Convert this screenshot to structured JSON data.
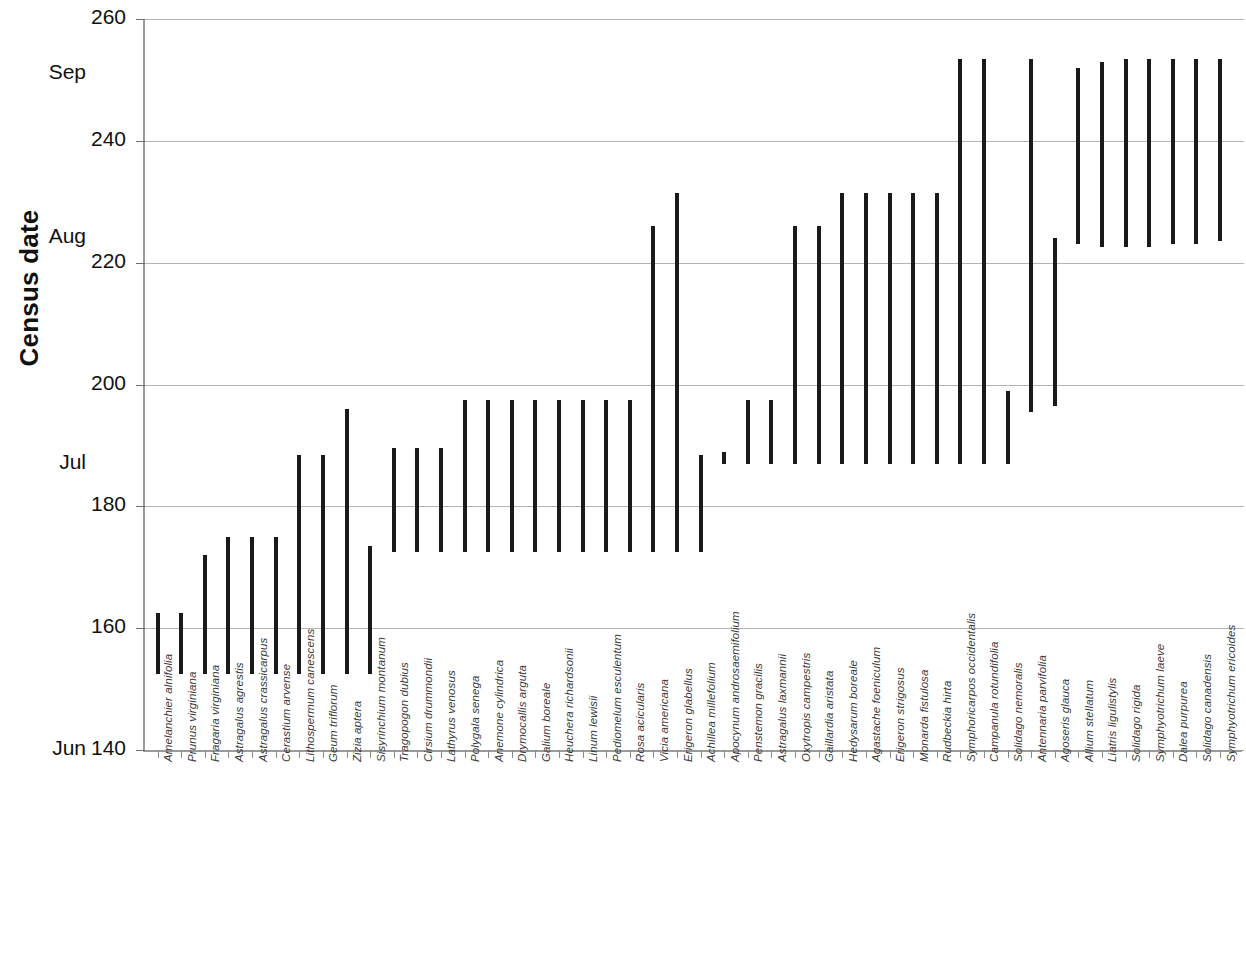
{
  "chart_data": {
    "type": "bar",
    "title": "",
    "subtitle": "",
    "xlabel": "",
    "ylabel": "Census date",
    "ylim": [
      140,
      260
    ],
    "ytick_values": [
      140,
      160,
      180,
      200,
      220,
      240,
      260
    ],
    "ytick_labels": [
      "140",
      "160",
      "180",
      "200",
      "220",
      "240",
      "260"
    ],
    "month_ticks": [
      {
        "label": "Jun",
        "value": 140
      },
      {
        "label": "Jul",
        "value": 187
      },
      {
        "label": "Aug",
        "value": 224
      },
      {
        "label": "Sep",
        "value": 251
      }
    ],
    "grid": true,
    "grid_axis": "y",
    "legend": "none",
    "orientation": "vertical",
    "bar_style": "floating-range",
    "value_unit": "day-of-year",
    "categories": [
      "Amelanchier alnifolia",
      "Prunus virginiana",
      "Fragaria virginiana",
      "Astragalus agrestis",
      "Astragalus crassicarpus",
      "Cerastium arvense",
      "Lithospermum canescens",
      "Geum triflorum",
      "Zizia aptera",
      "Sisyrinchium montanum",
      "Tragopogon dubius",
      "Cirsium drummondii",
      "Lathyrus venosus",
      "Polygala senega",
      "Anemone cylindrica",
      "Drymocallis arguta",
      "Galium boreale",
      "Heuchera richardsonii",
      "Linum lewisii",
      "Pediomelum esculentum",
      "Rosa acicularis",
      "Vicia americana",
      "Erigeron glabellus",
      "Achillea millefolium",
      "Apocynum androsaemifolium",
      "Penstemon gracilis",
      "Astragalus laxmannii",
      "Oxytropis campestris",
      "Gaillardia aristata",
      "Hedysarum boreale",
      "Agastache foeniculum",
      "Erigeron strigosus",
      "Monarda fistulosa",
      "Rudbeckia hirta",
      "Symphoricarpos occidentalis",
      "Campanula rotundifolia",
      "Solidago nemoralis",
      "Antennaria parvifolia",
      "Agoseris glauca",
      "Allium stellatum",
      "Liatris ligulistylis",
      "Solidago rigida",
      "Symphyotrichum laeve",
      "Dalea purpurea",
      "Solidago canadensis",
      "Symphyotrichum ericoides"
    ],
    "series": [
      {
        "name": "Flowering period (day of year)",
        "low": [
          152.5,
          152.5,
          152.5,
          152.5,
          152.5,
          152.5,
          152.5,
          152.5,
          152.5,
          152.5,
          172.5,
          172.5,
          172.5,
          172.5,
          172.5,
          172.5,
          172.5,
          172.5,
          172.5,
          172.5,
          172.5,
          172.5,
          172.5,
          172.5,
          187.0,
          187.0,
          187.0,
          187.0,
          187.0,
          187.0,
          187.0,
          187.0,
          187.0,
          187.0,
          187.0,
          187.0,
          187.0,
          195.5,
          196.5,
          223.0,
          222.5,
          222.5,
          222.5,
          223.0,
          223.0,
          223.5
        ],
        "high": [
          162.5,
          162.5,
          172.0,
          175.0,
          175.0,
          175.0,
          188.5,
          188.5,
          196.0,
          173.5,
          189.5,
          189.5,
          189.5,
          197.5,
          197.5,
          197.5,
          197.5,
          197.5,
          197.5,
          197.5,
          197.5,
          226.0,
          231.5,
          188.5,
          189.0,
          197.5,
          197.5,
          226.0,
          226.0,
          231.5,
          231.5,
          231.5,
          231.5,
          231.5,
          253.5,
          253.5,
          199.0,
          253.5,
          224.0,
          252.0,
          253.0,
          253.5,
          253.5,
          253.5,
          253.5,
          253.5
        ]
      }
    ],
    "note_bar_mapping": "Each vertical bar spans from its low (start of bloom) to high (end of bloom) census date."
  }
}
